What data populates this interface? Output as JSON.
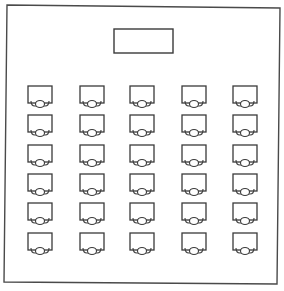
{
  "diagram": {
    "title": "",
    "type": "classroom seating layout",
    "colors": {
      "stroke": "#3a3a3a",
      "background": "#ffffff",
      "border": "#4a4a4a"
    },
    "room": {
      "corners": [
        [
          7,
          5
        ],
        [
          280,
          8
        ],
        [
          277,
          284
        ],
        [
          4,
          282
        ]
      ]
    },
    "front_board": {
      "label": "",
      "x": 114,
      "y": 29,
      "width": 59,
      "height": 24
    },
    "desk_size": {
      "width": 24,
      "height": 17
    },
    "columns_x": [
      28,
      80,
      130,
      182,
      233
    ],
    "rows_y": [
      86,
      115,
      145,
      174,
      203,
      233
    ],
    "rows": 6,
    "columns": 5,
    "desk_count": 30
  }
}
